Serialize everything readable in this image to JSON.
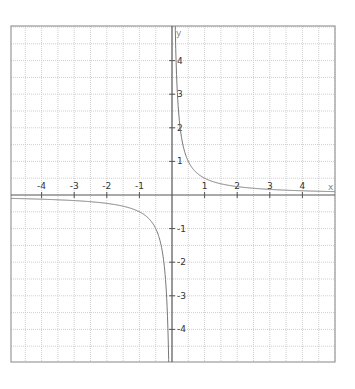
{
  "chart_data": {
    "type": "line",
    "title": "",
    "function": "y = 1/(2x)",
    "xlabel": "x",
    "ylabel": "y",
    "xlim": [
      -4.9,
      5.1
    ],
    "ylim": [
      -5.1,
      5.1
    ],
    "grid": true,
    "grid_minor_step": 0.5,
    "legend": null,
    "x_ticks": [
      -4,
      -3,
      -2,
      -1,
      1,
      2,
      3,
      4
    ],
    "y_ticks": [
      4,
      3,
      2,
      1,
      -1,
      -2,
      -3,
      -4
    ],
    "x_tick_labels": [
      "-4",
      "-3",
      "-2",
      "-1",
      "1",
      "2",
      "3",
      "4"
    ],
    "y_tick_labels": [
      "4",
      "3",
      "2",
      "1",
      "-1",
      "-2",
      "-3",
      "-4"
    ],
    "series": [
      {
        "name": "y = 1/(2x), x > 0",
        "x": [
          0.11,
          0.15,
          0.2,
          0.3,
          0.43,
          0.5,
          0.75,
          1,
          1.5,
          2,
          2.5,
          3,
          3.5,
          4,
          4.5,
          5
        ],
        "y": [
          4.55,
          3.33,
          2.5,
          1.67,
          1.16,
          1.0,
          0.67,
          0.5,
          0.33,
          0.25,
          0.2,
          0.17,
          0.14,
          0.125,
          0.11,
          0.1
        ]
      },
      {
        "name": "y = 1/(2x), x < 0",
        "x": [
          -4.9,
          -4.5,
          -4,
          -3.5,
          -3,
          -2.5,
          -2,
          -1.5,
          -1,
          -0.75,
          -0.5,
          -0.3,
          -0.2,
          -0.15,
          -0.12
        ],
        "y": [
          -0.1,
          -0.11,
          -0.125,
          -0.14,
          -0.17,
          -0.2,
          -0.25,
          -0.33,
          -0.5,
          -0.67,
          -1.0,
          -1.67,
          -2.5,
          -3.33,
          -4.17
        ]
      }
    ],
    "colors": {
      "frame": "#999999",
      "axis": "#555555",
      "grid": "#cfcfcf",
      "curve": "#777777",
      "background": "#ffffff"
    }
  },
  "layout": {
    "frame": {
      "left": 11,
      "top": 26,
      "right": 335,
      "bottom": 362
    },
    "origin": {
      "x": 172,
      "y": 195
    },
    "unit_px": {
      "x": 32.6,
      "y": 33.6
    }
  }
}
